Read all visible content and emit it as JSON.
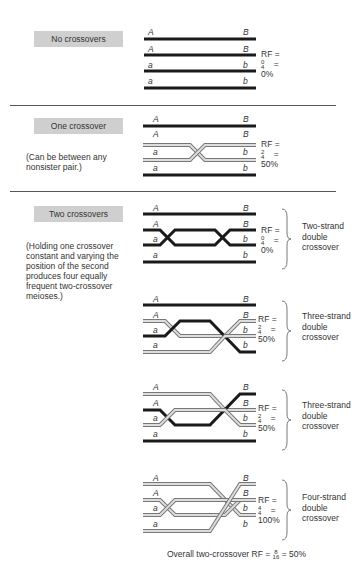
{
  "panels": [
    {
      "label": "No crossovers",
      "note": "",
      "rf": {
        "prefix": "RF =",
        "fraction": "0/4",
        "eq": "=",
        "percent": "0%"
      },
      "type": ""
    },
    {
      "label": "One crossover",
      "note": "(Can be between any nonsister pair.)",
      "rf": {
        "prefix": "RF =",
        "fraction": "2/4",
        "eq": "=",
        "percent": "50%"
      },
      "type": ""
    },
    {
      "label": "Two crossovers",
      "note": "(Holding one crossover constant and varying the position of the second produces four equally frequent two-crossover meioses.)",
      "rf": {
        "prefix": "RF =",
        "fraction": "0/4",
        "eq": "=",
        "percent": "0%"
      },
      "type": "Two-strand double crossover"
    },
    {
      "label": "",
      "note": "",
      "rf": {
        "prefix": "RF =",
        "fraction": "2/4",
        "eq": "=",
        "percent": "50%"
      },
      "type": "Three-strand double crossover"
    },
    {
      "label": "",
      "note": "",
      "rf": {
        "prefix": "RF =",
        "fraction": "2/4",
        "eq": "=",
        "percent": "50%"
      },
      "type": "Three-strand double crossover"
    },
    {
      "label": "",
      "note": "",
      "rf": {
        "prefix": "RF =",
        "fraction": "4/4",
        "eq": "=",
        "percent": "100%"
      },
      "type": "Four-strand double crossover"
    }
  ],
  "gene_labels": {
    "left_upper": "A",
    "right_upper": "B",
    "left_lower": "a",
    "right_lower": "b"
  },
  "overall": {
    "text": "Overall two-crossover RF =",
    "fraction": "8/16",
    "result": "= 50%"
  },
  "colors": {
    "parental_strand": "#1a1a1a",
    "recombinant_strand": "#bdbdbd",
    "label_box": "#cfcfcf"
  }
}
